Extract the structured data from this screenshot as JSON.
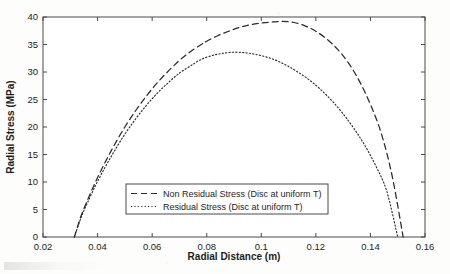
{
  "chart_data": {
    "type": "line",
    "title": "",
    "xlabel": "Radial Distance (m)",
    "ylabel": "Radial Stress (MPa)",
    "xlim": [
      0.02,
      0.16
    ],
    "ylim": [
      0,
      40
    ],
    "xticks": [
      "0.02",
      "0.04",
      "0.06",
      "0.08",
      "0.1",
      "0.12",
      "0.14",
      "0.16"
    ],
    "xtick_values": [
      0.02,
      0.04,
      0.06,
      0.08,
      0.1,
      0.12,
      0.14,
      0.16
    ],
    "yticks": [
      "0",
      "5",
      "10",
      "15",
      "20",
      "25",
      "30",
      "35",
      "40"
    ],
    "ytick_values": [
      0,
      5,
      10,
      15,
      20,
      25,
      30,
      35,
      40
    ],
    "grid": false,
    "legend_position": "lower center (inside axes)",
    "line_color": "#2b2b2b",
    "series": [
      {
        "name": "Non Residual Stress (Disc at uniform T)",
        "style": "dashed",
        "peak_x": 0.08,
        "peak_y": 39.2,
        "x": [
          0.0315,
          0.034,
          0.037,
          0.04,
          0.043,
          0.046,
          0.05,
          0.054,
          0.058,
          0.062,
          0.066,
          0.07,
          0.074,
          0.078,
          0.08,
          0.084,
          0.088,
          0.092,
          0.096,
          0.1,
          0.104,
          0.108,
          0.112,
          0.116,
          0.12,
          0.124,
          0.128,
          0.132,
          0.136,
          0.14,
          0.144,
          0.148,
          0.152
        ],
        "y": [
          0.0,
          3.9,
          7.5,
          10.8,
          13.8,
          16.6,
          20.0,
          23.0,
          25.7,
          28.1,
          30.2,
          32.1,
          33.7,
          35.0,
          35.6,
          36.6,
          37.4,
          38.1,
          38.6,
          38.9,
          39.1,
          39.2,
          39.0,
          38.4,
          37.4,
          36.0,
          34.1,
          31.6,
          28.3,
          24.1,
          18.8,
          11.0,
          0.0
        ]
      },
      {
        "name": "Residual Stress (Disc at uniform T)",
        "style": "dotted",
        "peak_x": 0.075,
        "peak_y": 33.6,
        "x": [
          0.0315,
          0.034,
          0.037,
          0.04,
          0.043,
          0.046,
          0.05,
          0.054,
          0.058,
          0.062,
          0.066,
          0.07,
          0.074,
          0.075,
          0.078,
          0.082,
          0.086,
          0.09,
          0.094,
          0.098,
          0.102,
          0.106,
          0.11,
          0.114,
          0.118,
          0.122,
          0.126,
          0.13,
          0.134,
          0.138,
          0.142,
          0.146,
          0.15
        ],
        "y": [
          0.0,
          3.6,
          7.0,
          10.1,
          12.9,
          15.5,
          18.7,
          21.5,
          24.0,
          26.2,
          28.1,
          29.8,
          31.1,
          31.4,
          32.3,
          33.0,
          33.4,
          33.6,
          33.5,
          33.2,
          32.7,
          32.0,
          31.0,
          29.8,
          28.4,
          26.7,
          24.7,
          22.4,
          19.7,
          16.6,
          12.9,
          8.3,
          0.0
        ]
      }
    ]
  },
  "legend": {
    "entries": [
      {
        "label": "Non Residual Stress (Disc at uniform T)",
        "style": "dashed"
      },
      {
        "label": "Residual Stress (Disc at uniform T)",
        "style": "dotted"
      }
    ]
  }
}
